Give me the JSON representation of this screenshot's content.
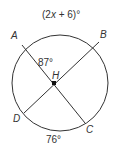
{
  "diagram": {
    "type": "circle-chords",
    "center_label": "H",
    "points": {
      "A": "A",
      "B": "B",
      "C": "C",
      "D": "D"
    },
    "arc_AB_label": "(2x + 6)°",
    "angle_AHB_label": "87°",
    "arc_DC_label": "76°",
    "colors": {
      "stroke": "#333333",
      "background": "#ffffff"
    }
  }
}
